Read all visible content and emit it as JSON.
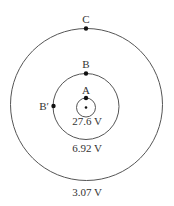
{
  "diagram": {
    "points": {
      "A": "A",
      "B": "B",
      "B_prime": "B′",
      "C": "C"
    },
    "potentials": {
      "inner": "27.6 V",
      "middle": "6.92 V",
      "outer": "3.07 V"
    },
    "colors": {
      "line": "#555555",
      "dot": "#111111",
      "text": "#333333"
    }
  }
}
